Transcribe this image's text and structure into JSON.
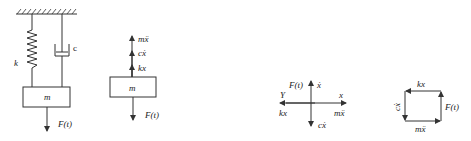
{
  "figure1": {
    "mass_label": "m",
    "spring_label": "k",
    "damper_label": "c",
    "force_label": "F(t)"
  },
  "figure2": {
    "mass_label": "m",
    "forces_up": [
      "mẍ",
      "cẋ",
      "kx"
    ],
    "force_down": "F(t)"
  },
  "figure3": {
    "force_up_label": "F(t)",
    "x_dot_label": "ẋ",
    "x_label": "x",
    "y_label": "Y",
    "left_label": "kx",
    "right_label": "mẍ",
    "down_label": "cẋ"
  },
  "figure4": {
    "top_label": "kx",
    "left_label": "cẋ",
    "right_label": "F(t)",
    "bottom_label": "mẍ"
  },
  "colors": {
    "stroke": "#333333",
    "text": "#222222",
    "background": "#ffffff"
  }
}
